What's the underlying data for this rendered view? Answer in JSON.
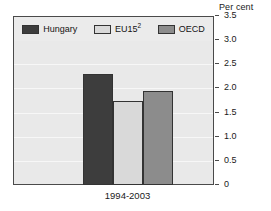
{
  "chart_data": {
    "type": "bar",
    "title": "",
    "subtitle": "",
    "xlabel": "",
    "ylabel": "Per cent",
    "unit_caption": "Per cent",
    "categories": [
      "1994-2003"
    ],
    "ylim": [
      0,
      3.5
    ],
    "ytick_values": [
      3.5,
      3.0,
      2.5,
      2.0,
      1.5,
      1.0,
      0.5,
      0
    ],
    "ytick_labels": [
      "3.5",
      "3.0",
      "2.5",
      "2.0",
      "1.5",
      "1.0",
      "0.5",
      "0"
    ],
    "grid": true,
    "grid_axis": "y",
    "legend_position": "top-inside",
    "series": [
      {
        "name": "Hungary",
        "label_html": "Hungary",
        "color": "#3d3d3d",
        "values": [
          2.3
        ]
      },
      {
        "name": "EU15",
        "label_html": "EU15<sup>2</sup>",
        "footnote_marker": "2",
        "color": "#d9d9d9",
        "values": [
          1.75
        ]
      },
      {
        "name": "OECD",
        "label_html": "OECD",
        "color": "#8c8c8c",
        "values": [
          1.95
        ]
      }
    ]
  },
  "colors": {
    "plot_background": "#e9e9e9",
    "legend_background": "#ebebeb",
    "frame_border": "#4a4a4a",
    "bar_border": "#333333",
    "gridline": "#f7f7f7",
    "text": "#1a1a1a",
    "page_background": "#ffffff"
  }
}
